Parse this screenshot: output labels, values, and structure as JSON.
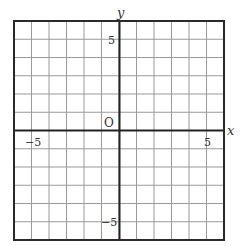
{
  "diagram": {
    "type": "coordinate-grid",
    "axis_labels": {
      "x": "x",
      "y": "y"
    },
    "origin_label": "O",
    "tick_labels": {
      "x_negative": "−5",
      "x_positive": "5",
      "y_positive": "5",
      "y_negative": "−5"
    },
    "x_range": [
      -6,
      6
    ],
    "y_range": [
      -6,
      6
    ],
    "grid_step": 1,
    "colors": {
      "border": "#2a2a2a",
      "axis": "#222222",
      "grid": "#9a9a9a",
      "label": "#333333",
      "background": "#ffffff"
    }
  }
}
